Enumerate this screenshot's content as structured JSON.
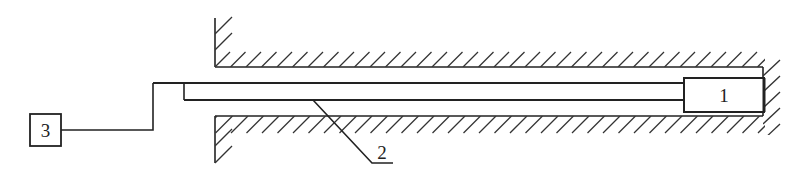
{
  "figure": {
    "type": "schematic",
    "colors": {
      "line": "#222222",
      "background": "#ffffff"
    }
  },
  "components": [
    {
      "id": "1",
      "label": "1",
      "shape": "rectangle",
      "role": "probe head at end of bore"
    },
    {
      "id": "2",
      "label": "2",
      "shape": "leader-line",
      "role": "rod / cable inside bore"
    },
    {
      "id": "3",
      "label": "3",
      "shape": "rectangle",
      "role": "external unit"
    }
  ],
  "labels": {
    "component_1": "1",
    "component_2": "2",
    "component_3": "3"
  }
}
